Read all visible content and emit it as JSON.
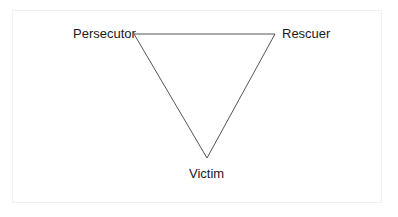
{
  "diagram": {
    "nodes": [
      {
        "id": "persecutor",
        "label": "Persecutor",
        "position": "top-left"
      },
      {
        "id": "rescuer",
        "label": "Rescuer",
        "position": "top-right"
      },
      {
        "id": "victim",
        "label": "Victim",
        "position": "bottom"
      }
    ],
    "edges": [
      {
        "from": "persecutor",
        "to": "rescuer"
      },
      {
        "from": "rescuer",
        "to": "victim"
      },
      {
        "from": "victim",
        "to": "persecutor"
      }
    ],
    "colors": {
      "line": "#555555",
      "text": "#1a1a1a",
      "frame": "#f1f1f1"
    }
  }
}
